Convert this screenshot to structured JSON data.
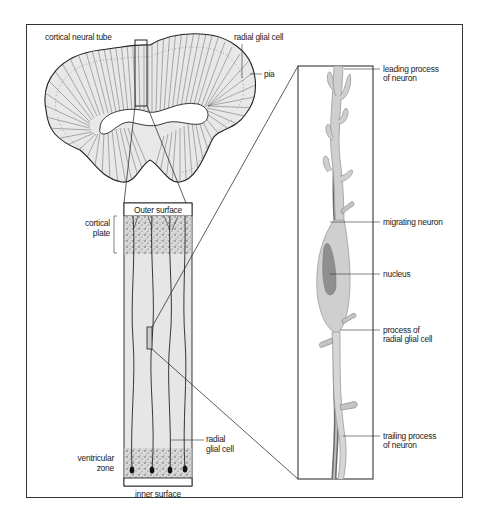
{
  "figure": {
    "type": "diagram",
    "panels": [
      {
        "id": "neural-tube",
        "label": "cortical neural tube"
      },
      {
        "id": "cortical-column",
        "label": "cortical column section"
      },
      {
        "id": "inset",
        "label": "magnified migrating neuron on radial glial fiber"
      }
    ]
  },
  "labels": {
    "cortical_neural_tube": "cortical neural tube",
    "radial_glial_cell_top": "radial glial cell",
    "pia": "pia",
    "outer_surface": "Outer surface",
    "cortical_plate_1": "cortical",
    "cortical_plate_2": "plate",
    "ventricular_zone_1": "ventricular",
    "ventricular_zone_2": "zone",
    "radial_glial_cell_col_1": "radial",
    "radial_glial_cell_col_2": "glial cell",
    "inner_surface": "inner surface",
    "leading_process_1": "leading process",
    "leading_process_2": "of neuron",
    "migrating_neuron": "migrating neuron",
    "nucleus": "nucleus",
    "process_radial_1": "process of",
    "process_radial_2": "radial glial cell",
    "trailing_process_1": "trailing process",
    "trailing_process_2": "of neuron"
  },
  "colors": {
    "outline": "#222222",
    "tissue_fill": "#e6e6e6",
    "neuron_fill": "#cfcfcf",
    "neuron_edge": "#9a9a9a",
    "nucleus_fill": "#8f8f8f",
    "glial_fiber": "#555555",
    "cell_dots": "#555555"
  }
}
